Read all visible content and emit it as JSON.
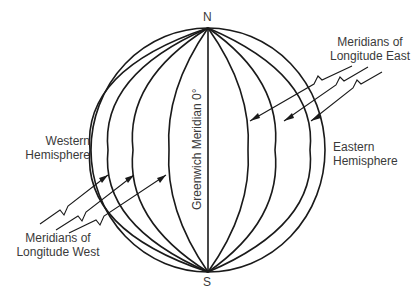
{
  "diagram": {
    "type": "globe-meridians",
    "poles": {
      "north": "N",
      "south": "S"
    },
    "center_line_label": "Greenwich Meridian 0°",
    "hemispheres": {
      "west": [
        "Western",
        "Hemisphere"
      ],
      "east": [
        "Eastern",
        "Hemisphere"
      ]
    },
    "callouts": {
      "west": [
        "Meridians of",
        "Longitude West"
      ],
      "east": [
        "Meridians of",
        "Longitude East"
      ]
    },
    "colors": {
      "line": "#1a1a1a",
      "text": "#3a3a3a",
      "background": "#ffffff"
    }
  }
}
